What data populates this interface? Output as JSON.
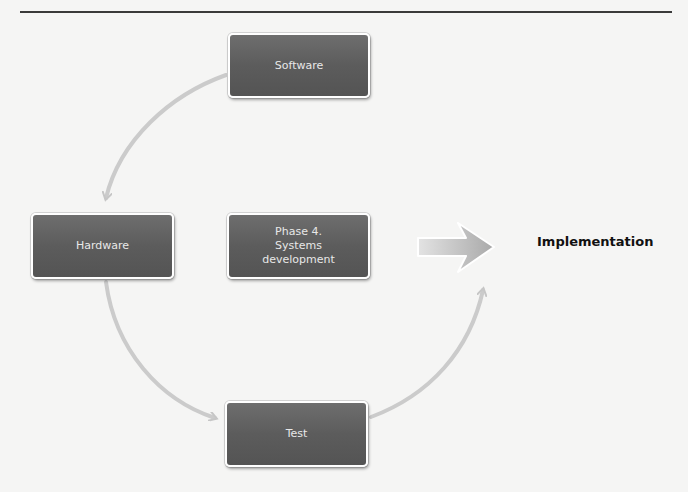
{
  "diagram": {
    "type": "cycle",
    "nodes": [
      {
        "id": "software",
        "label": "Software"
      },
      {
        "id": "hardware",
        "label": "Hardware"
      },
      {
        "id": "phase4",
        "label": "Phase 4.\nSystems\ndevelopment"
      },
      {
        "id": "test",
        "label": "Test"
      }
    ],
    "edges": [
      {
        "from": "software",
        "to": "hardware",
        "style": "curved-arrow"
      },
      {
        "from": "hardware",
        "to": "test",
        "style": "curved-arrow"
      },
      {
        "from": "test",
        "to": "implementation",
        "style": "curved-arrow"
      },
      {
        "from": "phase4",
        "to": "implementation",
        "style": "block-arrow"
      }
    ],
    "outcome": {
      "label": "Implementation"
    },
    "colors": {
      "node_fill": "#5f5f5f",
      "node_text": "#e8e8e8",
      "arrow": "#c9c9c9",
      "background": "#f5f5f4",
      "outcome_text": "#111111"
    }
  }
}
